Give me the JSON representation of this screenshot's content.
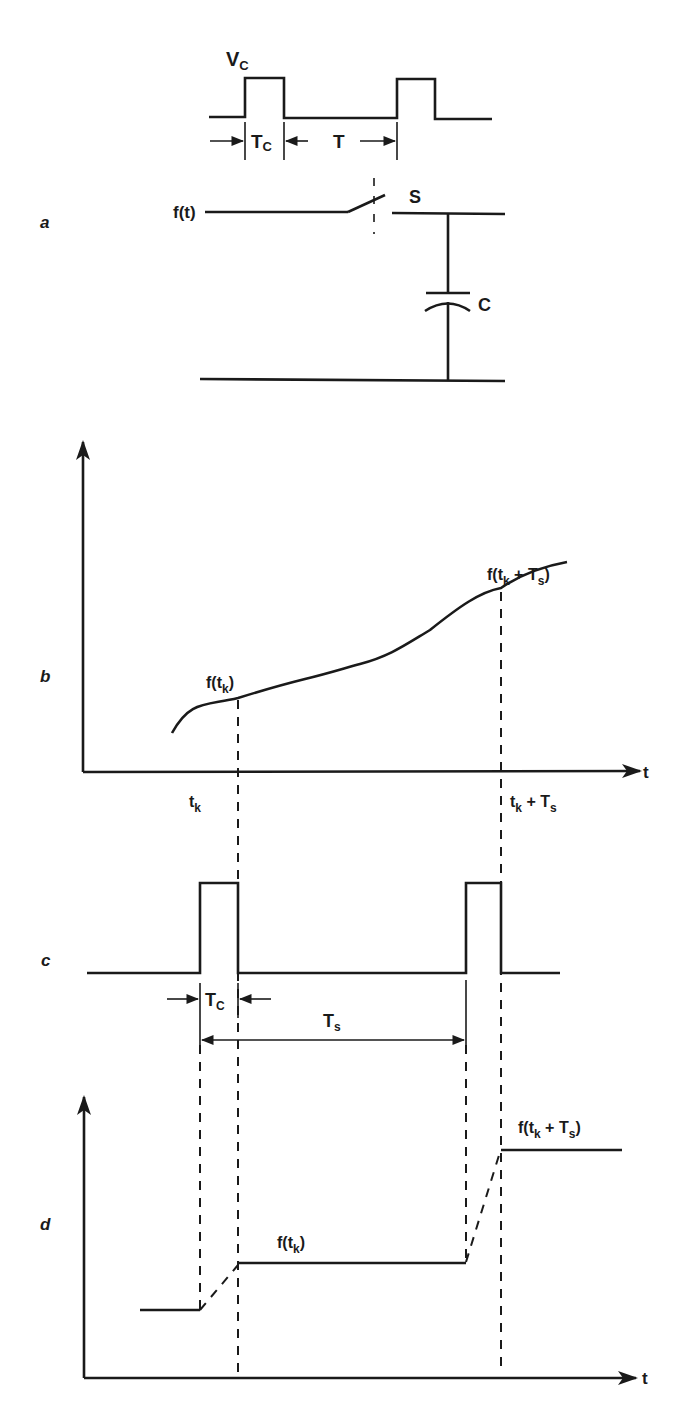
{
  "figure": {
    "panels": {
      "a": {
        "label": "a"
      },
      "b": {
        "label": "b"
      },
      "c": {
        "label": "c"
      },
      "d": {
        "label": "d"
      }
    },
    "panel_a": {
      "control_pulse_label": "V",
      "control_pulse_sub": "C",
      "pulse_width_label": "T",
      "pulse_width_sub": "C",
      "period_label": "T",
      "input_label": "f(t)",
      "switch_label": "S",
      "capacitor_label": "C"
    },
    "panel_b": {
      "axis_x_label": "t",
      "sample1_value_label": {
        "pre": "f(t",
        "sub": "k",
        "post": ")"
      },
      "sample2_value_label": {
        "pre": "f(t",
        "sub1": "k",
        "mid": " + T",
        "sub2": "s",
        "post": ")"
      },
      "tick1_label": {
        "pre": "t",
        "sub": "k"
      },
      "tick2_label": {
        "pre": "t",
        "sub1": "k",
        "mid": " + T",
        "sub2": "s"
      }
    },
    "panel_c": {
      "pulse_width_label": "T",
      "pulse_width_sub": "C",
      "sampling_period_label": "T",
      "sampling_period_sub": "s"
    },
    "panel_d": {
      "axis_x_label": "t",
      "hold1_label": {
        "pre": "f(t",
        "sub": "k",
        "post": ")"
      },
      "hold2_label": {
        "pre": "f(t",
        "sub1": "k",
        "mid": " + T",
        "sub2": "s",
        "post": ")"
      }
    }
  },
  "colors": {
    "ink": "#1a1a1a",
    "background": "#ffffff"
  }
}
